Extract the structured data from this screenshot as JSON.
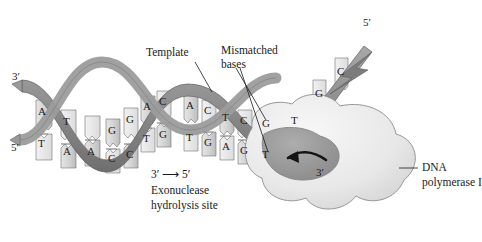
{
  "figure": {
    "background_color": "#ffffff",
    "ink_color": "#1a1a1a"
  },
  "labels": {
    "template": "Template",
    "mismatched_bases_line1": "Mismatched",
    "mismatched_bases_line2": "bases",
    "exonuclease_direction": "3′ ⟶ 5′",
    "exonuclease_line1": "Exonuclease",
    "exonuclease_line2": "hydrolysis site",
    "polymerase_line1": "DNA",
    "polymerase_line2": "polymerase I"
  },
  "end_labels": {
    "left_top": "3′",
    "left_bottom": "5′",
    "right_top": "5′",
    "active_site": "3′"
  },
  "colors": {
    "ribbon_light": "#c9c9c9",
    "ribbon_dark": "#8e8e8e",
    "base_fill": "#d6d6d6",
    "base_fill_light": "#ebebeb",
    "protein_fill": "#e9e9e9",
    "protein_cleft": "#9a9a9a",
    "outline": "#5a5a5a"
  },
  "duplex": {
    "top_strand_label": "template-strand",
    "bottom_strand_label": "primer-strand",
    "base_pairs": [
      {
        "top": "A",
        "bottom": "T",
        "matched": true
      },
      {
        "top": "T",
        "bottom": "A",
        "matched": true
      },
      {
        "top": "A",
        "bottom": "C",
        "matched": true
      },
      {
        "top": "G",
        "bottom": "C",
        "matched": true
      },
      {
        "top": "C",
        "bottom": "G",
        "matched": true
      },
      {
        "top": "A",
        "bottom": "T",
        "matched": true
      },
      {
        "top": "G",
        "bottom": "C",
        "matched": true
      },
      {
        "top": "A",
        "bottom": "T",
        "matched": true
      },
      {
        "top": "C",
        "bottom": "G",
        "matched": true
      },
      {
        "top": "T",
        "bottom": "A",
        "matched": true
      },
      {
        "top": "C",
        "bottom": "G",
        "matched": true
      },
      {
        "top": "G",
        "bottom": "T",
        "matched": false
      },
      {
        "top": "T",
        "bottom": "",
        "matched": true
      }
    ],
    "unpaired_template_bases": [
      "G",
      "C"
    ]
  },
  "bases_rendered": {
    "left_cluster": [
      {
        "letter": "A",
        "x": 43,
        "y": 112,
        "row": "top"
      },
      {
        "letter": "T",
        "x": 43,
        "y": 144,
        "row": "bottom"
      },
      {
        "letter": "T",
        "x": 68,
        "y": 122,
        "row": "top"
      },
      {
        "letter": "A",
        "x": 68,
        "y": 152,
        "row": "bottom"
      },
      {
        "letter": "A",
        "x": 92,
        "y": 152,
        "row": "bottom"
      }
    ],
    "mid_cluster": [
      {
        "letter": "G",
        "x": 113,
        "y": 131,
        "row": "top"
      },
      {
        "letter": "C",
        "x": 113,
        "y": 159,
        "row": "bottom"
      },
      {
        "letter": "G",
        "x": 131,
        "y": 121,
        "row": "top"
      },
      {
        "letter": "C",
        "x": 131,
        "y": 156,
        "row": "bottom"
      },
      {
        "letter": "A",
        "x": 148,
        "y": 108,
        "row": "top"
      },
      {
        "letter": "T",
        "x": 148,
        "y": 140,
        "row": "bottom"
      },
      {
        "letter": "C",
        "x": 164,
        "y": 103,
        "row": "top"
      },
      {
        "letter": "G",
        "x": 164,
        "y": 136,
        "row": "bottom"
      }
    ],
    "right_cluster": [
      {
        "letter": "A",
        "x": 191,
        "y": 107,
        "row": "top"
      },
      {
        "letter": "T",
        "x": 191,
        "y": 139,
        "row": "bottom"
      },
      {
        "letter": "C",
        "x": 209,
        "y": 112,
        "row": "top"
      },
      {
        "letter": "G",
        "x": 209,
        "y": 144,
        "row": "bottom"
      },
      {
        "letter": "T",
        "x": 227,
        "y": 119,
        "row": "top"
      },
      {
        "letter": "A",
        "x": 227,
        "y": 148,
        "row": "bottom"
      },
      {
        "letter": "C",
        "x": 245,
        "y": 122,
        "row": "top"
      },
      {
        "letter": "G",
        "x": 245,
        "y": 152,
        "row": "bottom"
      },
      {
        "letter": "G",
        "x": 267,
        "y": 125,
        "row": "top"
      },
      {
        "letter": "T",
        "x": 267,
        "y": 156,
        "row": "bottom"
      },
      {
        "letter": "T",
        "x": 296,
        "y": 122,
        "row": "top"
      },
      {
        "letter": "G",
        "x": 320,
        "y": 95,
        "row": "top"
      },
      {
        "letter": "C",
        "x": 342,
        "y": 73,
        "row": "top"
      }
    ]
  }
}
